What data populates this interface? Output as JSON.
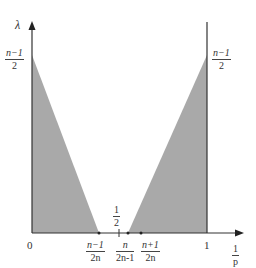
{
  "diagram": {
    "axes": {
      "y_label": "λ",
      "x_label": {
        "numerator": "1",
        "denominator": "p"
      },
      "origin_label": "0",
      "x_one_label": "1"
    },
    "y_ticks": {
      "left_apex": {
        "numerator": "n−1",
        "denominator": "2"
      },
      "right_apex": {
        "numerator": "n−1",
        "denominator": "2"
      }
    },
    "x_ticks": [
      {
        "id": "a",
        "numerator": "n−1",
        "denominator": "2n"
      },
      {
        "id": "half",
        "numerator": "1",
        "denominator": "2"
      },
      {
        "id": "b",
        "numerator": "n",
        "denominator": "2n-1"
      },
      {
        "id": "c",
        "numerator": "n+1",
        "denominator": "2n"
      }
    ],
    "regions": [
      {
        "name": "left-shaded-triangle",
        "vertices": [
          [
            0,
            "(n-1)/2"
          ],
          [
            0,
            0
          ],
          [
            "(n-1)/(2n)",
            0
          ]
        ]
      },
      {
        "name": "right-shaded-triangle",
        "vertices": [
          [
            "n/(2n-1)",
            0
          ],
          [
            1,
            0
          ],
          [
            1,
            "(n-1)/2"
          ]
        ]
      }
    ],
    "colors": {
      "shade": "#a9a9a9",
      "axis": "#333333",
      "line": "#444444"
    }
  }
}
